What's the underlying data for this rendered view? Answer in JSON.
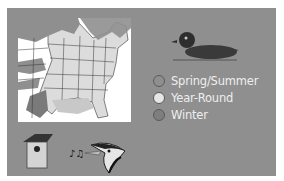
{
  "figure": {
    "colors": {
      "panel": "#8f8f8f",
      "map_background": "#ffffff",
      "spring_summer": "#8f8f8f",
      "year_round": "#dcdcdc",
      "winter": "#7a7a7a",
      "legend_text": "#eeeeee"
    }
  },
  "legend": {
    "items": [
      {
        "label": "Spring/Summer",
        "color": "#8f8f8f"
      },
      {
        "label": "Year-Round",
        "color": "#e6e6e6"
      },
      {
        "label": "Winter",
        "color": "#7e7e7e"
      }
    ]
  },
  "icons": {
    "duck": "wood-duck-icon",
    "birdhouse": "nest-box-icon",
    "notes": "music-notes-icon",
    "woodpecker": "bird-head-icon"
  }
}
